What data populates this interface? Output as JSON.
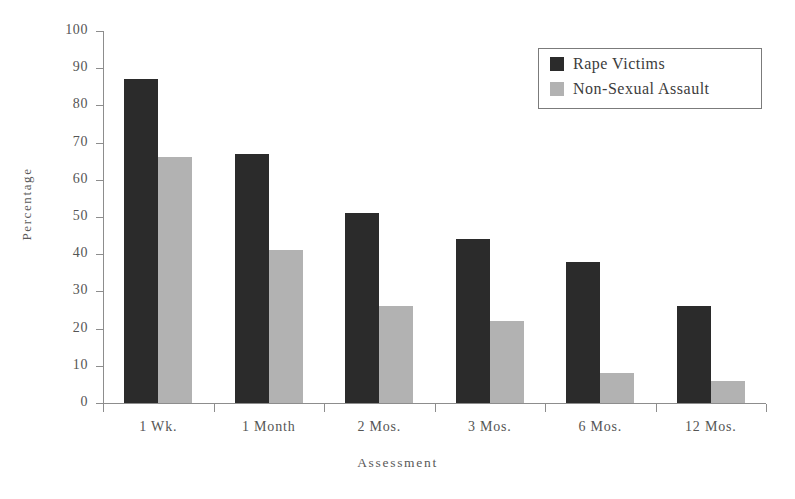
{
  "chart_data": {
    "type": "bar",
    "title": "",
    "subtitle": "",
    "xlabel": "Assessment",
    "ylabel": "Percentage",
    "categories": [
      "1 Wk.",
      "1 Month",
      "2 Mos.",
      "3 Mos.",
      "6 Mos.",
      "12 Mos."
    ],
    "series": [
      {
        "name": "Rape Victims",
        "color": "#2b2b2b",
        "values": [
          87,
          67,
          51,
          44,
          38,
          26
        ]
      },
      {
        "name": "Non-Sexual Assault",
        "color": "#b2b2b2",
        "values": [
          66,
          41,
          26,
          22,
          8,
          6
        ]
      }
    ],
    "ylim": [
      0,
      100
    ],
    "yticks": [
      0,
      10,
      20,
      30,
      40,
      50,
      60,
      70,
      80,
      90,
      100
    ],
    "ytick_labels": [
      "0",
      "10",
      "20",
      "30",
      "40",
      "50",
      "60",
      "70",
      "80",
      "90",
      "100"
    ],
    "grid": false,
    "legend_position": "top-right",
    "legend_entries": [
      "Rape Victims",
      "Non-Sexual Assault"
    ]
  },
  "legend": {
    "items": [
      {
        "label": "Rape Victims"
      },
      {
        "label": "Non-Sexual Assault"
      }
    ]
  },
  "axes": {
    "y_title": "Percentage",
    "x_title": "Assessment"
  }
}
